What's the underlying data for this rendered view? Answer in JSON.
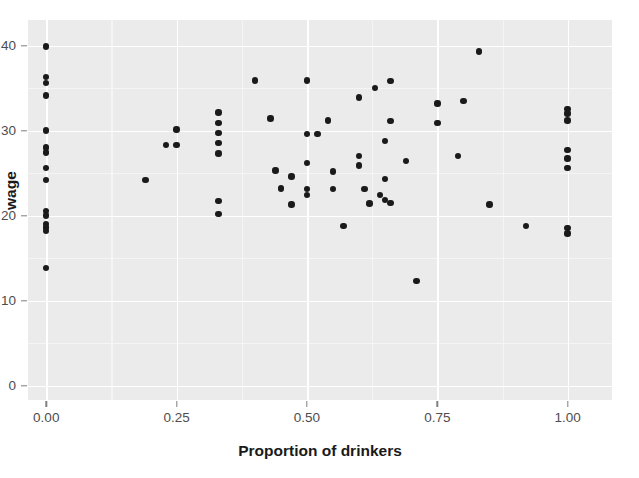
{
  "chart_data": {
    "type": "scatter",
    "title": "",
    "xlabel": "Proportion of drinkers",
    "ylabel": "wage",
    "xlim": [
      -0.035,
      1.085
    ],
    "ylim": [
      -1.7,
      43.0
    ],
    "xticks": [
      0.0,
      0.25,
      0.5,
      0.75,
      1.0
    ],
    "xtick_labels": [
      "0.00",
      "0.25",
      "0.50",
      "0.75",
      "1.00"
    ],
    "yticks": [
      0,
      10,
      20,
      30,
      40
    ],
    "ytick_labels": [
      "0",
      "10",
      "20",
      "30",
      "40"
    ],
    "grid": true,
    "grid_major_color": "#ffffff",
    "grid_minor_color": "#f5f5f5",
    "panel_background": "#ebebeb",
    "figure_background": "#ffffff",
    "point_color": "#1a1a1a",
    "point_size": 6.4,
    "legend": null,
    "n_points": 68,
    "points": [
      {
        "x": 0.0,
        "y": 39.9
      },
      {
        "x": 0.0,
        "y": 36.3
      },
      {
        "x": 0.0,
        "y": 35.6
      },
      {
        "x": 0.0,
        "y": 34.1
      },
      {
        "x": 0.0,
        "y": 30.0
      },
      {
        "x": 0.0,
        "y": 28.0
      },
      {
        "x": 0.0,
        "y": 27.4
      },
      {
        "x": 0.0,
        "y": 25.6
      },
      {
        "x": 0.0,
        "y": 24.2
      },
      {
        "x": 0.0,
        "y": 20.5
      },
      {
        "x": 0.0,
        "y": 20.0
      },
      {
        "x": 0.0,
        "y": 19.0
      },
      {
        "x": 0.0,
        "y": 18.6
      },
      {
        "x": 0.0,
        "y": 18.2
      },
      {
        "x": 0.0,
        "y": 13.8
      },
      {
        "x": 0.19,
        "y": 24.2
      },
      {
        "x": 0.23,
        "y": 28.3
      },
      {
        "x": 0.25,
        "y": 28.3
      },
      {
        "x": 0.25,
        "y": 30.1
      },
      {
        "x": 0.33,
        "y": 32.1
      },
      {
        "x": 0.33,
        "y": 30.9
      },
      {
        "x": 0.33,
        "y": 29.7
      },
      {
        "x": 0.33,
        "y": 28.5
      },
      {
        "x": 0.33,
        "y": 27.3
      },
      {
        "x": 0.33,
        "y": 21.7
      },
      {
        "x": 0.33,
        "y": 20.2
      },
      {
        "x": 0.4,
        "y": 35.9
      },
      {
        "x": 0.43,
        "y": 31.4
      },
      {
        "x": 0.44,
        "y": 25.3
      },
      {
        "x": 0.45,
        "y": 23.2
      },
      {
        "x": 0.47,
        "y": 24.6
      },
      {
        "x": 0.47,
        "y": 21.3
      },
      {
        "x": 0.5,
        "y": 35.9
      },
      {
        "x": 0.5,
        "y": 29.6
      },
      {
        "x": 0.5,
        "y": 26.2
      },
      {
        "x": 0.5,
        "y": 23.1
      },
      {
        "x": 0.5,
        "y": 22.4
      },
      {
        "x": 0.52,
        "y": 29.6
      },
      {
        "x": 0.54,
        "y": 31.2
      },
      {
        "x": 0.55,
        "y": 25.2
      },
      {
        "x": 0.55,
        "y": 23.1
      },
      {
        "x": 0.57,
        "y": 18.8
      },
      {
        "x": 0.6,
        "y": 33.9
      },
      {
        "x": 0.6,
        "y": 27.0
      },
      {
        "x": 0.6,
        "y": 25.9
      },
      {
        "x": 0.61,
        "y": 23.1
      },
      {
        "x": 0.62,
        "y": 21.4
      },
      {
        "x": 0.63,
        "y": 35.0
      },
      {
        "x": 0.64,
        "y": 22.4
      },
      {
        "x": 0.65,
        "y": 28.8
      },
      {
        "x": 0.65,
        "y": 24.3
      },
      {
        "x": 0.65,
        "y": 21.8
      },
      {
        "x": 0.66,
        "y": 21.5
      },
      {
        "x": 0.66,
        "y": 35.8
      },
      {
        "x": 0.66,
        "y": 31.1
      },
      {
        "x": 0.69,
        "y": 26.4
      },
      {
        "x": 0.71,
        "y": 12.3
      },
      {
        "x": 0.75,
        "y": 33.2
      },
      {
        "x": 0.75,
        "y": 30.9
      },
      {
        "x": 0.79,
        "y": 27.0
      },
      {
        "x": 0.8,
        "y": 33.5
      },
      {
        "x": 0.83,
        "y": 39.3
      },
      {
        "x": 0.85,
        "y": 21.3
      },
      {
        "x": 0.92,
        "y": 18.8
      },
      {
        "x": 1.0,
        "y": 32.5
      },
      {
        "x": 1.0,
        "y": 32.0
      },
      {
        "x": 1.0,
        "y": 31.2
      },
      {
        "x": 1.0,
        "y": 27.7
      },
      {
        "x": 1.0,
        "y": 26.7
      },
      {
        "x": 1.0,
        "y": 25.6
      },
      {
        "x": 1.0,
        "y": 18.5
      },
      {
        "x": 1.0,
        "y": 17.9
      }
    ]
  }
}
